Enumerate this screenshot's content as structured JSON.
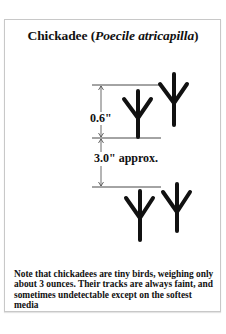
{
  "title": {
    "common_name": "Chickadee",
    "open_paren": " (",
    "scientific_name": "Poecile atricapilla",
    "close_paren": ")"
  },
  "measurements": {
    "track_length": "0.6\"",
    "stride": "3.0\" approx."
  },
  "tracks": {
    "icon": "bird-track-icon",
    "color": "#111111",
    "count": 4
  },
  "note": "Note that chickadees are tiny birds, weighing only about 3 ounces.  Their tracks are always faint, and sometimes undetectable except on the softest media"
}
